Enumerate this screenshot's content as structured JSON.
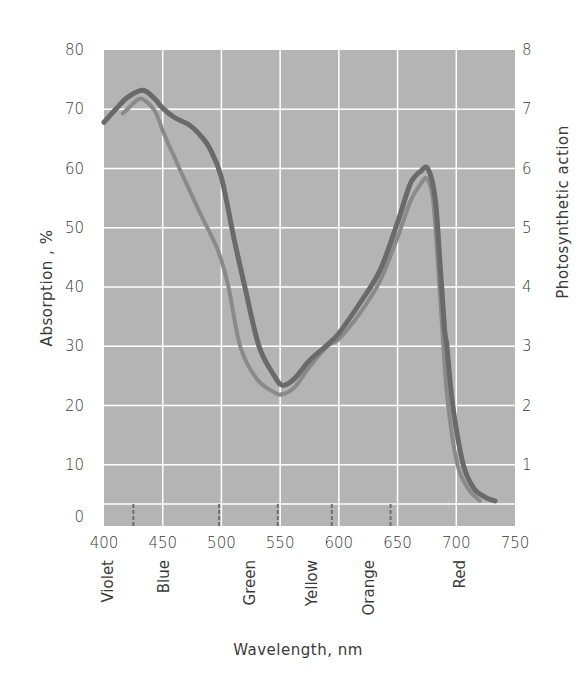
{
  "chart_data": {
    "type": "line",
    "title": "",
    "xlabel": "Wavelength, nm",
    "ylabel": "Absorption, %",
    "y2label": "Photosynthetic action",
    "xlim": [
      400,
      750
    ],
    "ylim": [
      0,
      80
    ],
    "y2lim": [
      0,
      8
    ],
    "grid": true,
    "x_ticks": [
      400,
      450,
      500,
      550,
      600,
      650,
      700,
      750
    ],
    "y_ticks": [
      0,
      10,
      20,
      30,
      40,
      50,
      60,
      70,
      80
    ],
    "y2_ticks": [
      1,
      2,
      3,
      4,
      5,
      6,
      7,
      8
    ],
    "series": [
      {
        "name": "Absorption",
        "axis": "left",
        "color": "#6a6a6a",
        "x": [
          400,
          410,
          420,
          433,
          443,
          450,
          460,
          473,
          482,
          490,
          500,
          511,
          520,
          532,
          545,
          552,
          562,
          575,
          590,
          600,
          618,
          635,
          650,
          661,
          670,
          676,
          682,
          686,
          690,
          692,
          697,
          706,
          715,
          725,
          733
        ],
        "values": [
          67.8,
          70,
          72,
          73.2,
          71.8,
          70.2,
          68.6,
          67.3,
          65.6,
          63.4,
          58.5,
          47.9,
          40,
          30,
          25,
          23.4,
          24.5,
          27.6,
          30.2,
          32.2,
          37.3,
          42.8,
          50.9,
          57.5,
          59.6,
          59.9,
          55,
          44.5,
          33,
          30,
          20,
          10,
          6,
          4.5,
          3.9
        ]
      },
      {
        "name": "Photosynthetic action",
        "axis": "right",
        "color": "#8a8a8a",
        "x": [
          416,
          420,
          425,
          432,
          443,
          450,
          456,
          460,
          465,
          482,
          497,
          506,
          516,
          530,
          545,
          552,
          562,
          575,
          590,
          600,
          618,
          635,
          650,
          661,
          670,
          675,
          680,
          684,
          689,
          693,
          701,
          710,
          720
        ],
        "values": [
          6.93,
          7.0,
          7.1,
          7.18,
          6.98,
          6.64,
          6.36,
          6.19,
          5.97,
          5.24,
          4.62,
          4.0,
          3.0,
          2.45,
          2.22,
          2.19,
          2.3,
          2.65,
          3.0,
          3.12,
          3.56,
          4.1,
          4.84,
          5.45,
          5.75,
          5.83,
          5.5,
          4.5,
          3.0,
          2.0,
          1.0,
          0.6,
          0.39
        ]
      }
    ],
    "spectrum_bands": [
      {
        "label": "Violet",
        "center_nm": 403
      },
      {
        "label": "Blue",
        "center_nm": 451
      },
      {
        "label": "Green",
        "center_nm": 524
      },
      {
        "label": "Yellow",
        "center_nm": 577
      },
      {
        "label": "Orange",
        "center_nm": 626
      },
      {
        "label": "Red",
        "center_nm": 703
      }
    ],
    "band_boundaries_nm": [
      425,
      498,
      548,
      594,
      644
    ]
  },
  "axes": {
    "left_title": "Absorption ,  %",
    "right_title": "Photosynthetic   action",
    "bottom_title": "Wavelength, nm"
  },
  "colors": {
    "plot_background": "#b4b4b4",
    "gridline": "#ffffff",
    "absorption_curve": "#6a6a6a",
    "action_curve": "#8a8a8a",
    "boundary_tick": "#6e6e6e"
  }
}
